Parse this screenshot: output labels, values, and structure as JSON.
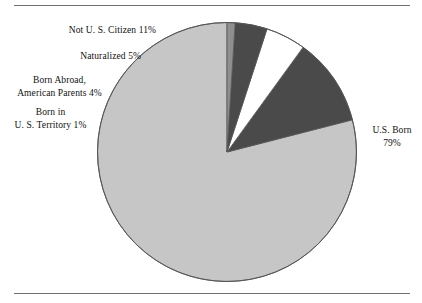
{
  "figure": {
    "rules": {
      "top_divider": "horizontal-rule",
      "bottom_divider": "horizontal-rule"
    }
  },
  "labels": {
    "not_citizen": "Not U. S. Citizen 11%",
    "naturalized": "Naturalized 5%",
    "born_abroad_line1": "Born Abroad,",
    "born_abroad_line2": "American Parents 4%",
    "born_territory_line1": "Born in",
    "born_territory_line2": "U. S. Territory 1%",
    "us_born_line1": "U.S. Born",
    "us_born_line2": "79%"
  },
  "chart_data": {
    "type": "pie",
    "title": "",
    "subtitle": "",
    "xlabel": "",
    "ylabel": "",
    "legend_position": "none",
    "grid": false,
    "units": "percent",
    "start_angle_deg": 90,
    "direction": "counterclockwise",
    "categories": [
      "U.S. Born",
      "Not U. S. Citizen",
      "Naturalized",
      "Born Abroad, American Parents",
      "Born in U. S. Territory"
    ],
    "values": [
      79,
      11,
      5,
      4,
      1
    ],
    "slices": [
      {
        "label": "U.S. Born",
        "value": 79,
        "value_text": "79%",
        "color": "#c6c6c6"
      },
      {
        "label": "Not U. S. Citizen",
        "value": 11,
        "value_text": "11%",
        "color": "#4a4a4a"
      },
      {
        "label": "Naturalized",
        "value": 5,
        "value_text": "5%",
        "color": "#ffffff"
      },
      {
        "label": "Born Abroad, American Parents",
        "value": 4,
        "value_text": "4%",
        "color": "#4a4a4a"
      },
      {
        "label": "Born in U. S. Territory",
        "value": 1,
        "value_text": "1%",
        "color": "#8f8f8f"
      }
    ],
    "colors": {
      "light_gray": "#c6c6c6",
      "dark_gray": "#4a4a4a",
      "white": "#ffffff",
      "medium_gray": "#8f8f8f",
      "outline": "#555555",
      "rule": "#6f6f6f"
    }
  }
}
